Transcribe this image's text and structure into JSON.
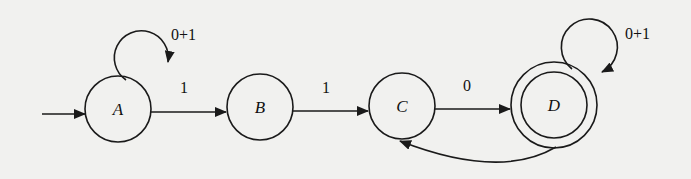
{
  "diagram": {
    "type": "finite-automaton",
    "start_state": "A",
    "accept_states": [
      "D"
    ],
    "states": [
      {
        "id": "A",
        "label": "A",
        "cx": 117,
        "cy": 108,
        "r": 33,
        "accepting": false
      },
      {
        "id": "B",
        "label": "B",
        "cx": 260,
        "cy": 108,
        "r": 33,
        "accepting": false
      },
      {
        "id": "C",
        "label": "C",
        "cx": 402,
        "cy": 106,
        "r": 33,
        "accepting": false
      },
      {
        "id": "D",
        "label": "D",
        "cx": 543,
        "cy": 105,
        "r": 33,
        "accepting": true
      }
    ],
    "transitions": [
      {
        "from": "A",
        "to": "A",
        "label": "0+1"
      },
      {
        "from": "A",
        "to": "B",
        "label": "1"
      },
      {
        "from": "B",
        "to": "C",
        "label": "1"
      },
      {
        "from": "C",
        "to": "D",
        "label": "0"
      },
      {
        "from": "D",
        "to": "D",
        "label": "0+1"
      },
      {
        "from": "D",
        "to": "C",
        "label": ""
      }
    ]
  },
  "labels": {
    "state_a": "A",
    "state_b": "B",
    "state_c": "C",
    "state_d": "D",
    "loop_a": "0+1",
    "edge_ab": "1",
    "edge_bc": "1",
    "edge_cd": "0",
    "loop_d": "0+1"
  },
  "colors": {
    "background": "#f1f1ef",
    "ink": "#1a1a1a"
  }
}
